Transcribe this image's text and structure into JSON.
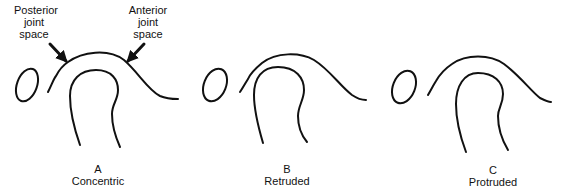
{
  "callouts": {
    "posterior": [
      "Posterior",
      "joint",
      "space"
    ],
    "anterior": [
      "Anterior",
      "joint",
      "space"
    ]
  },
  "panels": [
    {
      "letter": "A",
      "caption": "Concentric"
    },
    {
      "letter": "B",
      "caption": "Retruded"
    },
    {
      "letter": "C",
      "caption": "Protruded"
    }
  ],
  "colors": {
    "stroke": "#111111",
    "background": "#ffffff"
  }
}
